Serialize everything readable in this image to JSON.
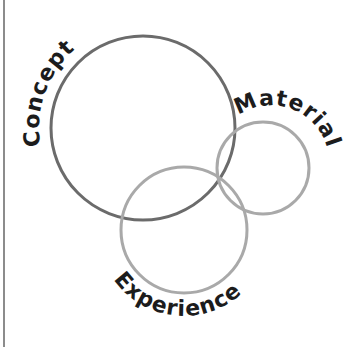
{
  "diagram": {
    "type": "venn",
    "sets": [
      {
        "id": "concept",
        "label": "Concept",
        "cx": 143,
        "cy": 128,
        "r": 92,
        "stroke_color": "#6b6b6b"
      },
      {
        "id": "material",
        "label": "Material",
        "cx": 263,
        "cy": 168,
        "r": 46,
        "stroke_color": "#a9a9a9"
      },
      {
        "id": "experience",
        "label": "Experience",
        "cx": 184,
        "cy": 230,
        "r": 63,
        "stroke_color": "#a9a9a9"
      }
    ],
    "text_color": "#1c1c1c",
    "border_color": "#8c8c8c"
  }
}
